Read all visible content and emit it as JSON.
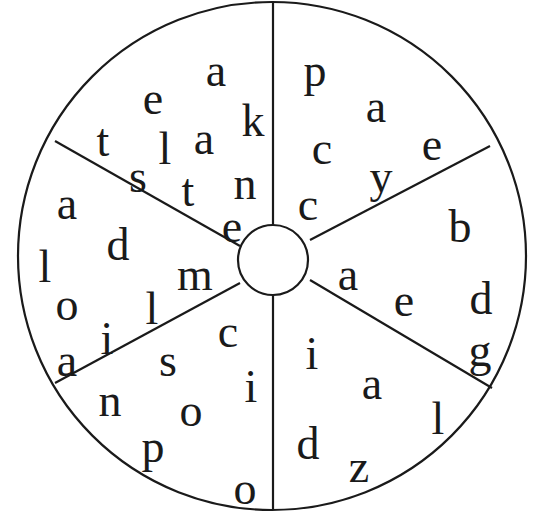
{
  "puzzle": {
    "type": "letter-wheel",
    "segments": [
      {
        "name": "top-left",
        "letters": [
          {
            "ch": "e",
            "x": 153,
            "y": 100
          },
          {
            "ch": "a",
            "x": 216,
            "y": 72
          },
          {
            "ch": "t",
            "x": 103,
            "y": 142
          },
          {
            "ch": "l",
            "x": 165,
            "y": 150
          },
          {
            "ch": "a",
            "x": 204,
            "y": 140
          },
          {
            "ch": "k",
            "x": 253,
            "y": 122
          },
          {
            "ch": "s",
            "x": 138,
            "y": 178
          },
          {
            "ch": "t",
            "x": 188,
            "y": 192
          },
          {
            "ch": "n",
            "x": 245,
            "y": 185
          },
          {
            "ch": "e",
            "x": 232,
            "y": 228
          }
        ]
      },
      {
        "name": "top-right",
        "letters": [
          {
            "ch": "p",
            "x": 315,
            "y": 72
          },
          {
            "ch": "a",
            "x": 376,
            "y": 108
          },
          {
            "ch": "c",
            "x": 322,
            "y": 150
          },
          {
            "ch": "e",
            "x": 432,
            "y": 146
          },
          {
            "ch": "y",
            "x": 381,
            "y": 178
          },
          {
            "ch": "c",
            "x": 308,
            "y": 206
          }
        ]
      },
      {
        "name": "right",
        "letters": [
          {
            "ch": "b",
            "x": 460,
            "y": 228
          },
          {
            "ch": "a",
            "x": 348,
            "y": 276
          },
          {
            "ch": "e",
            "x": 404,
            "y": 302
          },
          {
            "ch": "d",
            "x": 481,
            "y": 300
          },
          {
            "ch": "g",
            "x": 480,
            "y": 352
          }
        ]
      },
      {
        "name": "bottom-right",
        "letters": [
          {
            "ch": "i",
            "x": 312,
            "y": 355
          },
          {
            "ch": "a",
            "x": 372,
            "y": 385
          },
          {
            "ch": "l",
            "x": 438,
            "y": 420
          },
          {
            "ch": "d",
            "x": 308,
            "y": 445
          },
          {
            "ch": "z",
            "x": 359,
            "y": 468
          }
        ]
      },
      {
        "name": "bottom-left",
        "letters": [
          {
            "ch": "c",
            "x": 228,
            "y": 333
          },
          {
            "ch": "s",
            "x": 168,
            "y": 362
          },
          {
            "ch": "i",
            "x": 251,
            "y": 388
          },
          {
            "ch": "n",
            "x": 110,
            "y": 402
          },
          {
            "ch": "o",
            "x": 191,
            "y": 412
          },
          {
            "ch": "p",
            "x": 153,
            "y": 448
          },
          {
            "ch": "o",
            "x": 245,
            "y": 490
          }
        ]
      },
      {
        "name": "left",
        "letters": [
          {
            "ch": "a",
            "x": 67,
            "y": 205
          },
          {
            "ch": "d",
            "x": 118,
            "y": 246
          },
          {
            "ch": "l",
            "x": 45,
            "y": 268
          },
          {
            "ch": "m",
            "x": 195,
            "y": 276
          },
          {
            "ch": "o",
            "x": 67,
            "y": 306
          },
          {
            "ch": "l",
            "x": 152,
            "y": 310
          },
          {
            "ch": "i",
            "x": 107,
            "y": 340
          },
          {
            "ch": "a",
            "x": 67,
            "y": 362
          }
        ]
      }
    ]
  },
  "colors": {
    "ink": "#1a1a1a",
    "background": "#ffffff"
  }
}
